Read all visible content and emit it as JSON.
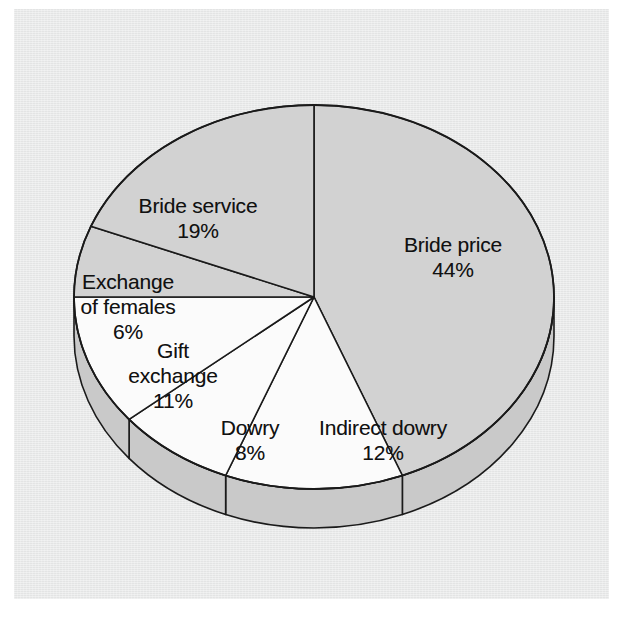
{
  "chart_data": {
    "type": "pie",
    "title": "",
    "subtitle": "",
    "xlabel": "",
    "ylabel": "",
    "legend_position": "none",
    "grid": false,
    "style": "3d-exploded-none",
    "units": "percent",
    "total": 100,
    "categories": [
      "Bride price",
      "Indirect dowry",
      "Dowry",
      "Gift exchange",
      "Exchange of females",
      "Bride service"
    ],
    "values": [
      44,
      12,
      8,
      11,
      6,
      19
    ],
    "labels": [
      "Bride price 44%",
      "Indirect dowry 12%",
      "Dowry 8%",
      "Gift exchange 11%",
      "Exchange of females 6%",
      "Bride service 19%"
    ],
    "slices": [
      {
        "name": "Bride price",
        "name_line1": "Bride price",
        "name_line2": "",
        "value": 44,
        "percent_label": "44%",
        "fill": "#d2d2d2",
        "start_deg": 0,
        "end_deg": 158.4
      },
      {
        "name": "Indirect dowry",
        "name_line1": "Indirect dowry",
        "name_line2": "",
        "value": 12,
        "percent_label": "12%",
        "fill": "#fbfbfb",
        "start_deg": 158.4,
        "end_deg": 201.6
      },
      {
        "name": "Dowry",
        "name_line1": "Dowry",
        "name_line2": "",
        "value": 8,
        "percent_label": "8%",
        "fill": "#fbfbfb",
        "start_deg": 201.6,
        "end_deg": 230.4
      },
      {
        "name": "Gift exchange",
        "name_line1": "Gift",
        "name_line2": "exchange",
        "value": 11,
        "percent_label": "11%",
        "fill": "#fbfbfb",
        "start_deg": 230.4,
        "end_deg": 270.0
      },
      {
        "name": "Exchange of females",
        "name_line1": "Exchange",
        "name_line2": "of females",
        "value": 6,
        "percent_label": "6%",
        "fill": "#d2d2d2",
        "start_deg": 270.0,
        "end_deg": 291.6
      },
      {
        "name": "Bride service",
        "name_line1": "Bride service",
        "name_line2": "",
        "value": 19,
        "percent_label": "19%",
        "fill": "#d2d2d2",
        "start_deg": 291.6,
        "end_deg": 360.0
      }
    ],
    "colors": {
      "gray_slice": "#d2d2d2",
      "white_slice": "#fbfbfb",
      "side_wall": "#c9c9c9",
      "outline": "#1a1a1a",
      "background": "#e9eaea",
      "page": "#ffffff",
      "label_text": "#111111"
    },
    "geometry": {
      "center_x": 314,
      "center_y": 297,
      "radius_x": 240,
      "radius_y": 192,
      "depth": 39
    }
  }
}
